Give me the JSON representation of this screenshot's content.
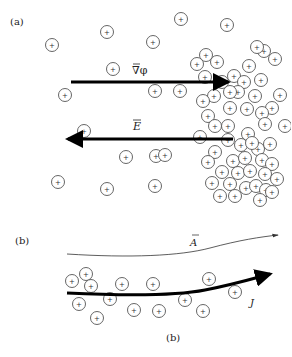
{
  "panel_a": {
    "label": "(a)",
    "grad_phi_label": "∇φ",
    "e_field_label": "E",
    "ion_symbol": "+",
    "ions": [
      [
        181,
        19
      ],
      [
        52,
        45
      ],
      [
        107,
        32
      ],
      [
        227,
        25
      ],
      [
        153,
        42
      ],
      [
        206,
        55
      ],
      [
        264,
        51
      ],
      [
        113,
        69
      ],
      [
        65,
        95
      ],
      [
        197,
        64
      ],
      [
        217,
        62
      ],
      [
        234,
        76
      ],
      [
        249,
        66
      ],
      [
        275,
        59
      ],
      [
        257,
        47
      ],
      [
        205,
        77
      ],
      [
        222,
        82
      ],
      [
        244,
        82
      ],
      [
        261,
        80
      ],
      [
        280,
        95
      ],
      [
        238,
        92
      ],
      [
        255,
        96
      ],
      [
        272,
        108
      ],
      [
        230,
        92
      ],
      [
        214,
        96
      ],
      [
        203,
        101
      ],
      [
        230,
        108
      ],
      [
        247,
        109
      ],
      [
        262,
        113
      ],
      [
        208,
        116
      ],
      [
        155,
        91
      ],
      [
        180,
        91
      ],
      [
        215,
        126
      ],
      [
        228,
        126
      ],
      [
        248,
        134
      ],
      [
        265,
        124
      ],
      [
        285,
        126
      ],
      [
        200,
        137
      ],
      [
        241,
        145
      ],
      [
        258,
        149
      ],
      [
        270,
        144
      ],
      [
        228,
        140
      ],
      [
        156,
        156
      ],
      [
        215,
        152
      ],
      [
        233,
        161
      ],
      [
        245,
        158
      ],
      [
        262,
        160
      ],
      [
        272,
        164
      ],
      [
        222,
        172
      ],
      [
        238,
        173
      ],
      [
        250,
        171
      ],
      [
        265,
        174
      ],
      [
        277,
        179
      ],
      [
        212,
        183
      ],
      [
        230,
        184
      ],
      [
        246,
        188
      ],
      [
        256,
        186
      ],
      [
        266,
        190
      ],
      [
        126,
        157
      ],
      [
        165,
        155
      ],
      [
        84,
        131
      ],
      [
        155,
        186
      ],
      [
        58,
        182
      ],
      [
        107,
        189
      ],
      [
        208,
        162
      ],
      [
        252,
        143
      ],
      [
        272,
        192
      ],
      [
        235,
        196
      ],
      [
        220,
        196
      ],
      [
        260,
        200
      ]
    ]
  },
  "panel_b": {
    "label": "(b)",
    "a_label": "A",
    "j_label": "J",
    "caption": "(b)",
    "ion_symbol": "+",
    "ions": [
      [
        72,
        281
      ],
      [
        86,
        274
      ],
      [
        91,
        286
      ],
      [
        122,
        284
      ],
      [
        153,
        284
      ],
      [
        79,
        304
      ],
      [
        110,
        299
      ],
      [
        97,
        318
      ],
      [
        134,
        310
      ],
      [
        159,
        311
      ],
      [
        185,
        300
      ],
      [
        209,
        279
      ],
      [
        203,
        311
      ],
      [
        235,
        292
      ]
    ]
  },
  "colors": {
    "arrow": "#000000",
    "thin_arrow": "#333333",
    "ion_stroke": "#555555",
    "text": "#222222"
  }
}
